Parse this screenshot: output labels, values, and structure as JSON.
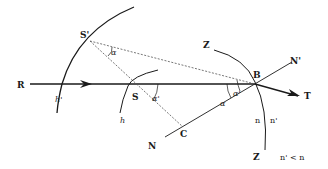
{
  "diagram": {
    "title": "",
    "labels": {
      "S_prime": "S'",
      "S": "S",
      "R": "R",
      "T": "T",
      "B": "B",
      "C": "C",
      "N": "N",
      "N_prime": "N'",
      "Z_top": "Z",
      "Z_bottom": "Z",
      "h_prime": "h'",
      "h": "h",
      "alpha": "α",
      "alpha_at_B": "α",
      "alpha_prime_at_B": "α'",
      "alpha_prime_at_S": "α'",
      "n": "n",
      "n_prime": "n'",
      "condition": "n' < n"
    },
    "colors": {
      "line": "#1a1a1a",
      "dashed": "#555555",
      "background": "#ffffff"
    }
  }
}
